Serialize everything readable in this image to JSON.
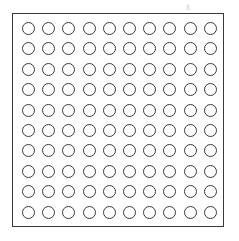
{
  "diagram": {
    "type": "dot-grid",
    "rows": 10,
    "columns": 10,
    "total_circles": 100,
    "circle_style": "outline",
    "stroke_color": "#3a3a3a",
    "background": "#ffffff",
    "faint_mark": "ß"
  }
}
